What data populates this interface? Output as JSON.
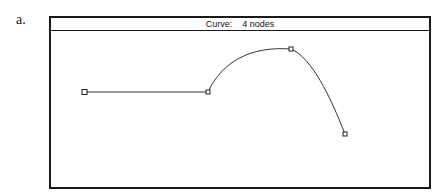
{
  "figure_label": "a.",
  "window": {
    "title": "Curve:    4 nodes"
  },
  "curve": {
    "node_count": 4,
    "nodes": [
      {
        "x": 84,
        "y": 92,
        "type": "start"
      },
      {
        "x": 208,
        "y": 92,
        "type": "node"
      },
      {
        "x": 291,
        "y": 49,
        "type": "node"
      },
      {
        "x": 345,
        "y": 134,
        "type": "end"
      }
    ],
    "segments": [
      "line",
      "curve",
      "curve"
    ],
    "stroke_color": "#333333"
  }
}
